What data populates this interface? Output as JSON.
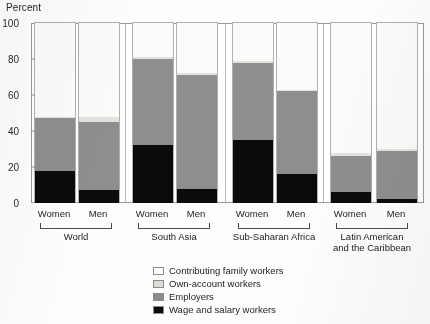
{
  "chart_data": {
    "type": "bar",
    "subtype": "stacked-100-percent",
    "title": "",
    "xlabel": "",
    "ylabel": "Percent",
    "ylim": [
      0,
      100
    ],
    "yticks": [
      0,
      20,
      40,
      60,
      80,
      100
    ],
    "grid": false,
    "legend_position": "bottom-center",
    "categories": [
      "World - Women",
      "World - Men",
      "South Asia - Women",
      "South Asia - Men",
      "Sub-Saharan Africa - Women",
      "Sub-Saharan Africa - Men",
      "Latin American and the Caribbean - Women",
      "Latin American and the Caribbean - Men"
    ],
    "groups": [
      {
        "label": "World",
        "bars": [
          "Women",
          "Men"
        ]
      },
      {
        "label": "South Asia",
        "bars": [
          "Women",
          "Men"
        ]
      },
      {
        "label": "Sub-Saharan Africa",
        "bars": [
          "Women",
          "Men"
        ]
      },
      {
        "label": "Latin American and the Caribbean",
        "bars": [
          "Women",
          "Men"
        ]
      }
    ],
    "series": [
      {
        "name": "Wage and salary workers",
        "color": "#0b0b0b",
        "values": [
          18,
          7,
          32,
          8,
          35,
          16,
          6,
          2
        ]
      },
      {
        "name": "Employers",
        "color": "#8e8e8e",
        "values": [
          29,
          38,
          48,
          63,
          43,
          46,
          20,
          27
        ]
      },
      {
        "name": "Own-account workers",
        "color": "#e2e2df",
        "values": [
          1,
          3,
          1,
          1,
          1,
          1,
          2,
          1
        ]
      },
      {
        "name": "Contributing family workers",
        "color": "#fbfbfa",
        "values": [
          52,
          52,
          19,
          28,
          21,
          37,
          72,
          70
        ]
      }
    ],
    "cumulative_tops": {
      "World - Women": [
        18,
        47,
        48,
        100
      ],
      "World - Men": [
        7,
        45,
        48,
        100
      ],
      "South Asia - Women": [
        32,
        80,
        81,
        100
      ],
      "South Asia - Men": [
        8,
        71,
        72,
        100
      ],
      "Sub-Saharan Africa - Women": [
        35,
        78,
        79,
        100
      ],
      "Sub-Saharan Africa - Men": [
        16,
        62,
        63,
        100
      ],
      "Latin American and the Caribbean - Women": [
        6,
        26,
        28,
        100
      ],
      "Latin American and the Caribbean - Men": [
        2,
        29,
        30,
        100
      ]
    }
  },
  "legend": {
    "items": [
      {
        "key": "contributing",
        "label": "Contributing family workers"
      },
      {
        "key": "ownaccount",
        "label": "Own-account workers"
      },
      {
        "key": "employers",
        "label": "Employers"
      },
      {
        "key": "wage",
        "label": "Wage and salary workers"
      }
    ]
  },
  "axis": {
    "y_title": "Percent",
    "ticks": [
      "100",
      "80",
      "60",
      "40",
      "20",
      "0"
    ]
  },
  "groups": [
    {
      "label": "World",
      "bars": [
        {
          "label": "Women"
        },
        {
          "label": "Men"
        }
      ]
    },
    {
      "label": "South Asia",
      "bars": [
        {
          "label": "Women"
        },
        {
          "label": "Men"
        }
      ]
    },
    {
      "label": "Sub-Saharan Africa",
      "bars": [
        {
          "label": "Women"
        },
        {
          "label": "Men"
        }
      ]
    },
    {
      "label": "Latin American\nand the Caribbean",
      "label_line1": "Latin American",
      "label_line2": "and the Caribbean",
      "bars": [
        {
          "label": "Women"
        },
        {
          "label": "Men"
        }
      ]
    }
  ],
  "colors": {
    "contributing": "#fbfbfa",
    "ownaccount": "#e2e2df",
    "employers": "#8e8e8e",
    "wage": "#0b0b0b",
    "frame": "#9a9a9a",
    "text": "#1a1a1a"
  }
}
